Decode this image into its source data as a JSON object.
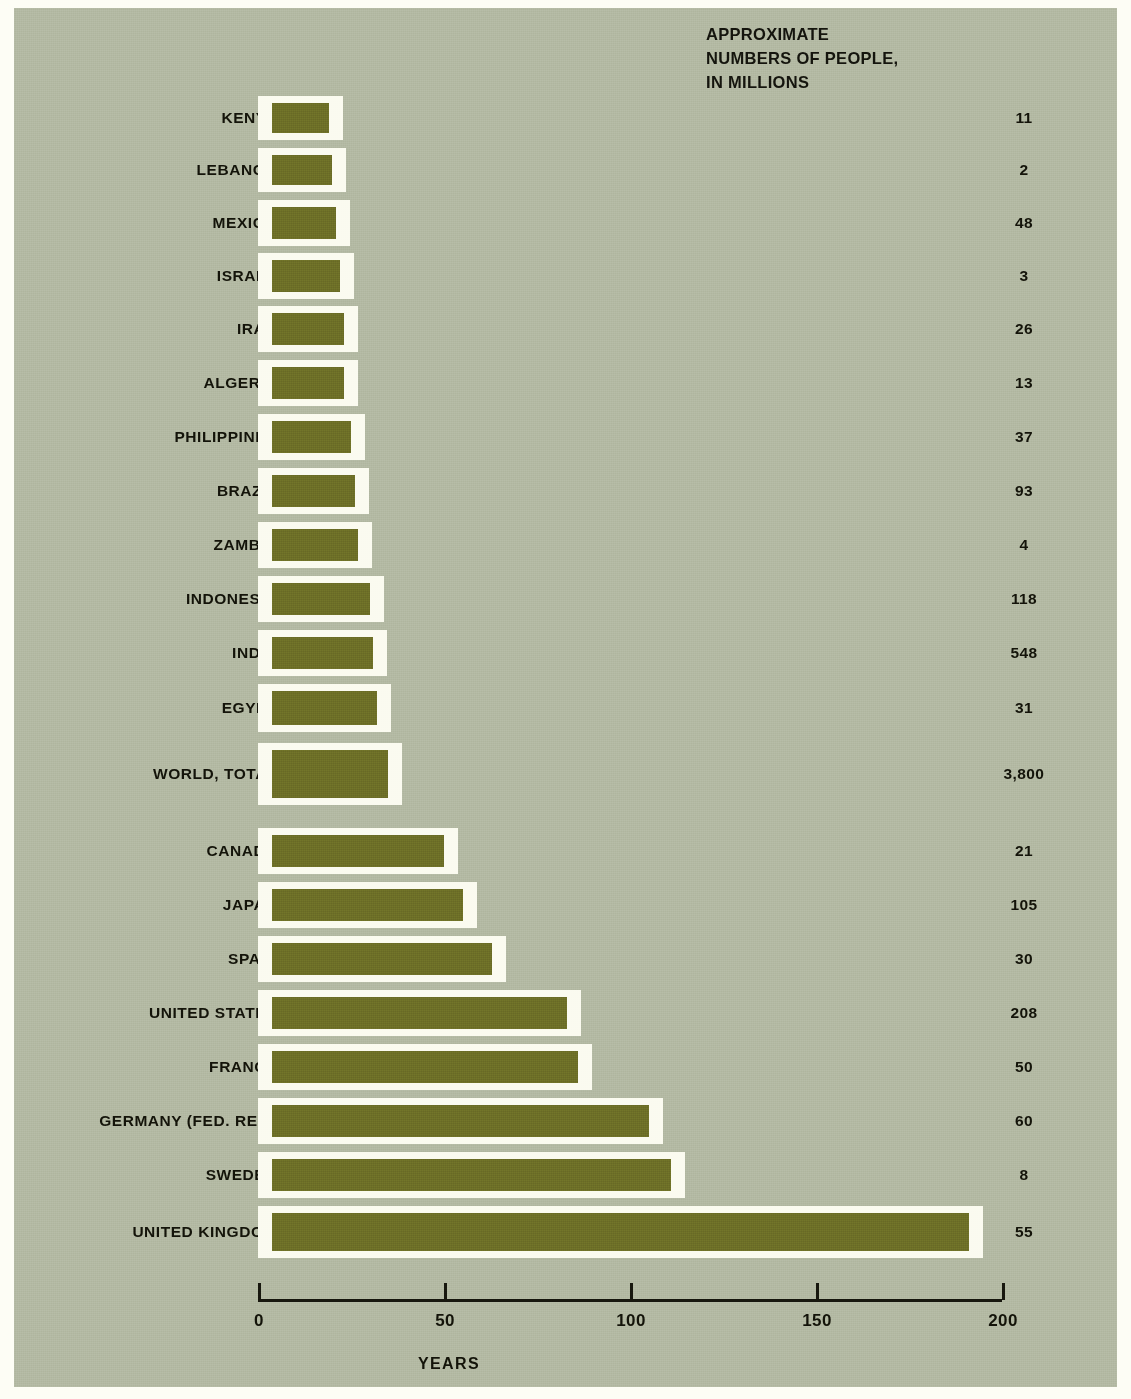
{
  "header": {
    "value_column_title": "APPROXIMATE\nNUMBERS OF PEOPLE,\nIN MILLIONS"
  },
  "axis": {
    "x_title": "YEARS",
    "ticks": [
      "0",
      "50",
      "100",
      "150",
      "200"
    ]
  },
  "colors": {
    "background": "#b3b9a3",
    "bar_fill": "#6d6f27",
    "bar_outline": "#fbfbf0",
    "text": "#131309",
    "page": "#fdfdf5"
  },
  "chart_data": {
    "type": "bar",
    "orientation": "horizontal",
    "title": "",
    "xlabel": "YEARS",
    "ylabel": "",
    "xlim": [
      0,
      200
    ],
    "grid": false,
    "legend": false,
    "value_column_header": "APPROXIMATE NUMBERS OF PEOPLE, IN MILLIONS",
    "categories": [
      "KENYA",
      "LEBANON",
      "MEXICO",
      "ISRAEL",
      "IRAN",
      "ALGERIA",
      "PHILIPPINES",
      "BRAZIL",
      "ZAMBIA",
      "INDONESIA",
      "INDIA",
      "EGYPT",
      "WORLD, TOTAL",
      "CANADA",
      "JAPAN",
      "SPAIN",
      "UNITED STATES",
      "FRANCE",
      "GERMANY (FED. REP.)",
      "SWEDEN",
      "UNITED KINGDOM"
    ],
    "values": [
      19,
      20,
      21,
      22,
      23,
      23,
      25,
      26,
      27,
      30,
      31,
      32,
      35,
      50,
      55,
      63,
      83,
      86,
      105,
      111,
      191
    ],
    "population_millions": [
      "11",
      "2",
      "48",
      "3",
      "26",
      "13",
      "37",
      "93",
      "4",
      "118",
      "548",
      "31",
      "3,800",
      "21",
      "105",
      "30",
      "208",
      "50",
      "60",
      "8",
      "55"
    ],
    "rows": [
      {
        "label": "KENYA",
        "years": 19,
        "population": "11"
      },
      {
        "label": "LEBANON",
        "years": 20,
        "population": "2"
      },
      {
        "label": "MEXICO",
        "years": 21,
        "population": "48"
      },
      {
        "label": "ISRAEL",
        "years": 22,
        "population": "3"
      },
      {
        "label": "IRAN",
        "years": 23,
        "population": "26"
      },
      {
        "label": "ALGERIA",
        "years": 23,
        "population": "13"
      },
      {
        "label": "PHILIPPINES",
        "years": 25,
        "population": "37"
      },
      {
        "label": "BRAZIL",
        "years": 26,
        "population": "93"
      },
      {
        "label": "ZAMBIA",
        "years": 27,
        "population": "4"
      },
      {
        "label": "INDONESIA",
        "years": 30,
        "population": "118"
      },
      {
        "label": "INDIA",
        "years": 31,
        "population": "548"
      },
      {
        "label": "EGYPT",
        "years": 32,
        "population": "31"
      },
      {
        "label": "WORLD, TOTAL",
        "years": 35,
        "population": "3,800"
      },
      {
        "label": "CANADA",
        "years": 50,
        "population": "21"
      },
      {
        "label": "JAPAN",
        "years": 55,
        "population": "105"
      },
      {
        "label": "SPAIN",
        "years": 63,
        "population": "30"
      },
      {
        "label": "UNITED STATES",
        "years": 83,
        "population": "208"
      },
      {
        "label": "FRANCE",
        "years": 86,
        "population": "50"
      },
      {
        "label": "GERMANY (FED. REP.)",
        "years": 105,
        "population": "60"
      },
      {
        "label": "SWEDEN",
        "years": 111,
        "population": "8"
      },
      {
        "label": "UNITED KINGDOM",
        "years": 191,
        "population": "55"
      }
    ]
  },
  "layout": {
    "row_tops": [
      88,
      140,
      192,
      245,
      298,
      352,
      406,
      460,
      514,
      568,
      622,
      676,
      735,
      820,
      874,
      928,
      982,
      1036,
      1090,
      1144,
      1198
    ],
    "row_heights": [
      44,
      44,
      46,
      46,
      46,
      46,
      46,
      46,
      46,
      46,
      46,
      48,
      62,
      46,
      46,
      46,
      46,
      46,
      46,
      46,
      52
    ],
    "origin_x": 244,
    "px_per_year": 3.72
  }
}
